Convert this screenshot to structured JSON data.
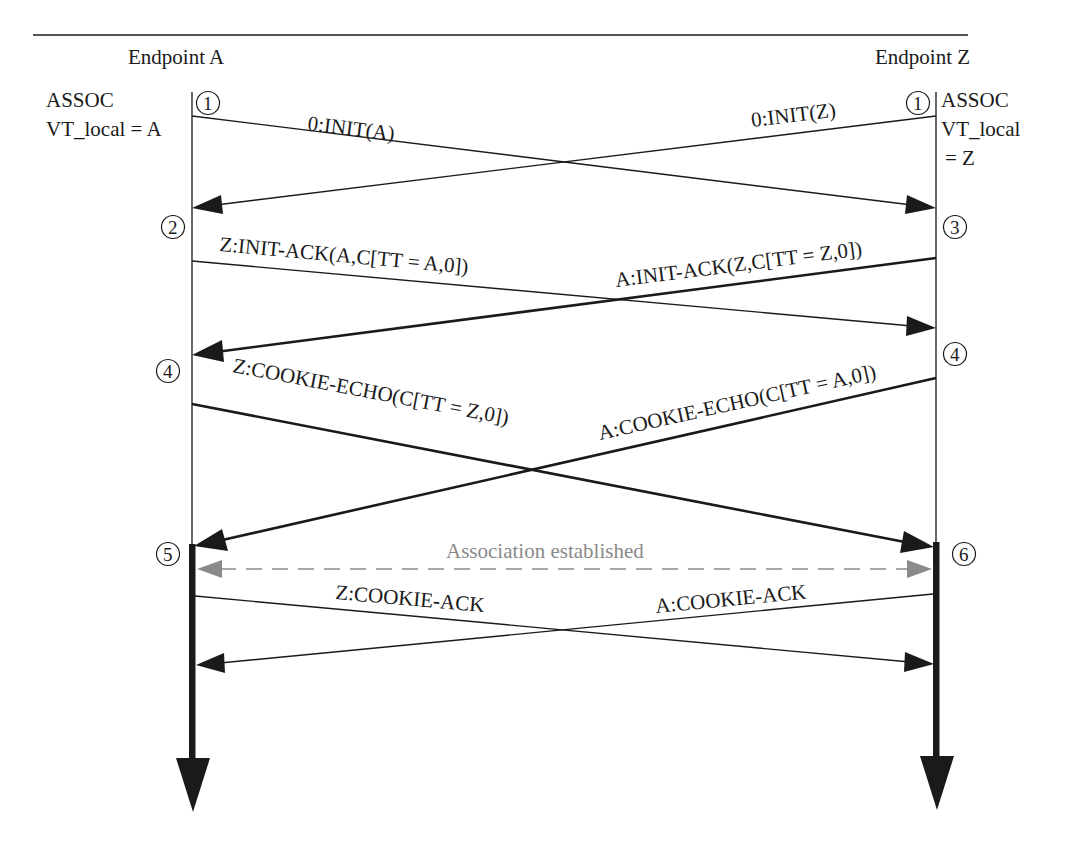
{
  "diagram": {
    "type": "sequence",
    "title_rule": true,
    "endpoints": [
      {
        "id": "A",
        "label": "Endpoint A",
        "state_line1": "ASSOC",
        "state_line2": "VT_local = A"
      },
      {
        "id": "Z",
        "label": "Endpoint Z",
        "state_line1": "ASSOC",
        "state_line2": "VT_local",
        "state_line3": "= Z"
      }
    ],
    "steps": {
      "a1": "①",
      "z1": "①",
      "a2": "②",
      "z3": "③",
      "a4": "④",
      "z4": "④",
      "a5": "⑤",
      "z6": "⑥"
    },
    "messages": [
      {
        "id": "init_a",
        "label": "0:INIT(A)",
        "from": "A",
        "to": "Z",
        "weight": "thin"
      },
      {
        "id": "init_z",
        "label": "0:INIT(Z)",
        "from": "Z",
        "to": "A",
        "weight": "thin"
      },
      {
        "id": "init_ack_z",
        "label": "Z:INIT-ACK(A,C[TT = A,0])",
        "from": "A",
        "to": "Z",
        "weight": "thin"
      },
      {
        "id": "init_ack_a",
        "label": "A:INIT-ACK(Z,C[TT = Z,0])",
        "from": "Z",
        "to": "A",
        "weight": "thick"
      },
      {
        "id": "cookie_echo_z",
        "label": "Z:COOKIE-ECHO(C[TT = Z,0])",
        "from": "A",
        "to": "Z",
        "weight": "thick"
      },
      {
        "id": "cookie_echo_a",
        "label": "A:COOKIE-ECHO(C[TT = A,0])",
        "from": "Z",
        "to": "A",
        "weight": "thick"
      },
      {
        "id": "assoc",
        "label": "Association established",
        "from": "both",
        "to": "both",
        "weight": "dashed",
        "color": "#8a8a8a"
      },
      {
        "id": "cookie_ack_z",
        "label": "Z:COOKIE-ACK",
        "from": "A",
        "to": "Z",
        "weight": "thin"
      },
      {
        "id": "cookie_ack_a",
        "label": "A:COOKIE-ACK",
        "from": "Z",
        "to": "A",
        "weight": "thin"
      }
    ],
    "colors": {
      "line": "#1a1a1a",
      "dashed": "#8a8a8a",
      "background": "#ffffff"
    }
  }
}
